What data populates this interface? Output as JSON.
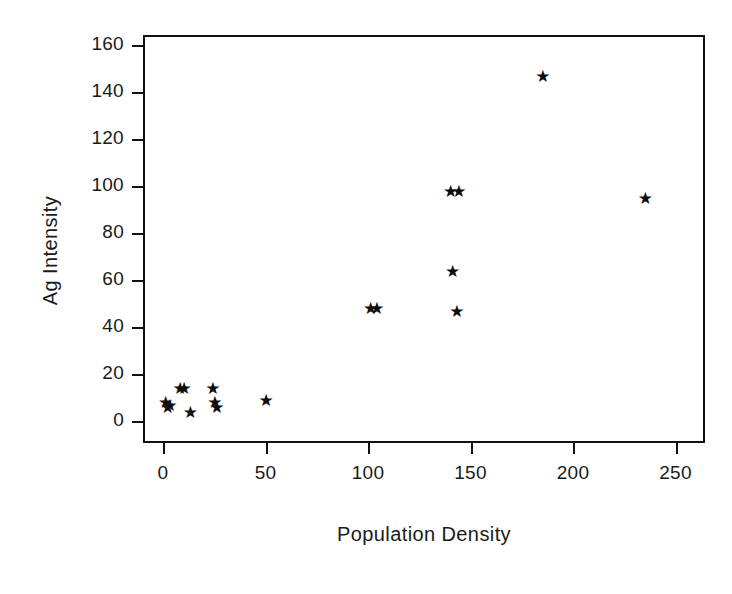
{
  "chart_data": {
    "type": "scatter",
    "title": "",
    "xlabel": "Population Density",
    "ylabel": "Ag Intensity",
    "xlim": [
      -10,
      265
    ],
    "ylim": [
      -5,
      168
    ],
    "xticks": [
      0,
      50,
      100,
      150,
      200,
      250
    ],
    "yticks": [
      0,
      20,
      40,
      60,
      80,
      100,
      120,
      140,
      160
    ],
    "xticklabels": [
      "0",
      "50",
      "100",
      "150",
      "200",
      "250"
    ],
    "yticklabels": [
      "0",
      "20",
      "40",
      "60",
      "80",
      "100",
      "120",
      "140",
      "160"
    ],
    "grid": false,
    "legend": null,
    "marker": "star",
    "marker_color": "#0d0d0d",
    "frame_color": "#111111",
    "background": "#ffffff",
    "series": [
      {
        "name": "Ag Intensity",
        "points": [
          {
            "x": 1,
            "y": 8
          },
          {
            "x": 2,
            "y": 6
          },
          {
            "x": 3,
            "y": 7
          },
          {
            "x": 8,
            "y": 14
          },
          {
            "x": 10,
            "y": 14
          },
          {
            "x": 13,
            "y": 4
          },
          {
            "x": 24,
            "y": 14
          },
          {
            "x": 25,
            "y": 8
          },
          {
            "x": 26,
            "y": 6
          },
          {
            "x": 50,
            "y": 9
          },
          {
            "x": 101,
            "y": 48
          },
          {
            "x": 104,
            "y": 48
          },
          {
            "x": 140,
            "y": 98
          },
          {
            "x": 144,
            "y": 98
          },
          {
            "x": 141,
            "y": 64
          },
          {
            "x": 143,
            "y": 47
          },
          {
            "x": 185,
            "y": 147
          },
          {
            "x": 235,
            "y": 95
          }
        ]
      }
    ]
  }
}
